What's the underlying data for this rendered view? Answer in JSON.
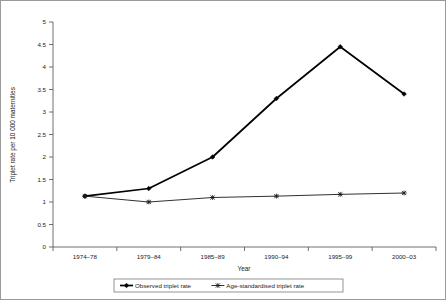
{
  "chart_data": {
    "type": "line",
    "title": "",
    "xlabel": "Year",
    "ylabel": "Triplet rate per 10 000 maternities",
    "categories": [
      "1974–78",
      "1979–84",
      "1985–89",
      "1990–94",
      "1995–99",
      "2000–03"
    ],
    "ylim": [
      0,
      5
    ],
    "ytick_labels": [
      "0",
      "0.5",
      "1",
      "1.5",
      "2",
      "2.5",
      "3",
      "3.5",
      "4",
      "4.5",
      "5"
    ],
    "ytick_values": [
      0,
      0.5,
      1,
      1.5,
      2,
      2.5,
      3,
      3.5,
      4,
      4.5,
      5
    ],
    "grid": false,
    "legend_position": "bottom-center",
    "series": [
      {
        "name": "Observed triplet rate",
        "marker": "diamond",
        "color": "#000000",
        "line_width": 1.7,
        "values": [
          1.13,
          1.3,
          2.0,
          3.3,
          4.45,
          3.4
        ]
      },
      {
        "name": "Age-standardised triplet rate",
        "marker": "star",
        "color": "#1a1a1a",
        "line_width": 0.9,
        "values": [
          1.13,
          1.0,
          1.1,
          1.13,
          1.17,
          1.2
        ]
      }
    ]
  },
  "axes": {
    "y_title": "Triplet rate per 10 000 maternities",
    "x_title": "Year"
  },
  "legend": {
    "items": [
      {
        "label": "Observed triplet rate"
      },
      {
        "label": "Age-standardised triplet rate"
      }
    ]
  }
}
